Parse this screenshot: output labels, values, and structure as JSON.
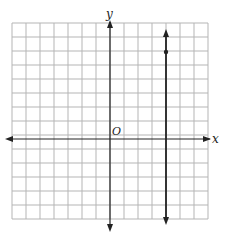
{
  "diagram": {
    "type": "coordinate-grid",
    "x_axis_label": "x",
    "y_axis_label": "y",
    "origin_label": "O",
    "grid": {
      "x_min": -7,
      "x_max": 7,
      "y_min": -6,
      "y_max": 8,
      "step": 1
    },
    "graphed_line": {
      "equation": "x = 4",
      "marked_point": [
        4,
        6
      ]
    },
    "colors": {
      "grid": "#b5b5b5",
      "axis": "#222222",
      "line": "#222222"
    }
  }
}
